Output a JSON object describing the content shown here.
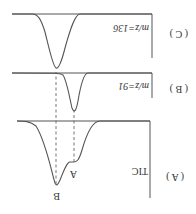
{
  "figure": {
    "rotation_deg": 180,
    "panels": [
      {
        "id": "A",
        "label": "( A )",
        "trace_label": "TIC",
        "peaks": [
          "A",
          "B"
        ]
      },
      {
        "id": "B",
        "label": "( B )",
        "trace_label": "m/z=91"
      },
      {
        "id": "C",
        "label": "( C )",
        "trace_label": "m/z=136"
      }
    ],
    "peak_labels": {
      "peak_a": "A",
      "peak_b": "B"
    },
    "colors": {
      "line": "#555555",
      "text": "#333333",
      "background": "#ffffff"
    }
  }
}
